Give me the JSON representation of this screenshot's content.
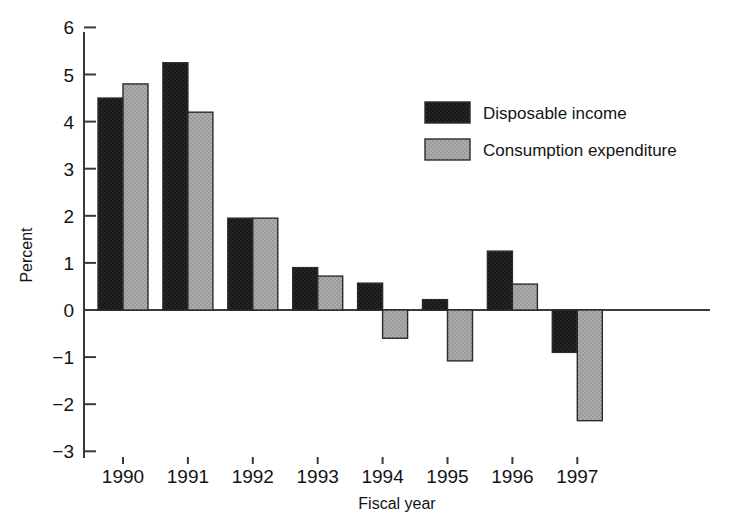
{
  "chart_data": {
    "type": "bar",
    "title": "",
    "subtitle": "",
    "xlabel": "Fiscal year",
    "ylabel": "Percent",
    "categories": [
      "1990",
      "1991",
      "1992",
      "1993",
      "1994",
      "1995",
      "1996",
      "1997"
    ],
    "series": [
      {
        "name": "Disposable income",
        "color": "#1c1c1c",
        "values": [
          4.5,
          5.25,
          1.95,
          0.9,
          0.57,
          0.22,
          1.25,
          -0.9
        ]
      },
      {
        "name": "Consumption expenditure",
        "color": "#a8a8a8",
        "values": [
          4.8,
          4.2,
          1.95,
          0.72,
          -0.6,
          -1.08,
          0.55,
          -2.35
        ]
      }
    ],
    "ylim": [
      -3,
      6
    ],
    "yticks": [
      "6",
      "5",
      "4",
      "3",
      "2",
      "1",
      "0",
      "-1",
      "-2",
      "-3"
    ],
    "ytick_values": [
      6,
      5,
      4,
      3,
      2,
      1,
      0,
      -1,
      -2,
      -3
    ],
    "grid": false,
    "legend_position": "upper-right-inside",
    "axis_color": "#3a3a3a",
    "background": "#ffffff"
  },
  "legend": {
    "items": [
      {
        "label": "Disposable income",
        "swatch": "#1c1c1c"
      },
      {
        "label": "Consumption expenditure",
        "swatch": "#a8a8a8"
      }
    ]
  },
  "axes": {
    "y_title": "Percent",
    "x_title": "Fiscal year"
  }
}
